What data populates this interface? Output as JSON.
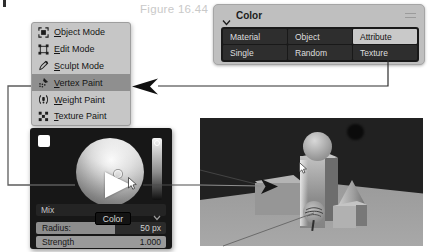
{
  "figure": {
    "caption": "Figure 16.44"
  },
  "mode_menu": {
    "items": [
      {
        "label": "Object Mode",
        "icon": "object-mode-icon",
        "selected": false
      },
      {
        "label": "Edit Mode",
        "icon": "edit-mode-icon",
        "selected": false
      },
      {
        "label": "Sculpt Mode",
        "icon": "sculpt-mode-icon",
        "selected": false
      },
      {
        "label": "Vertex Paint",
        "icon": "vertex-paint-icon",
        "selected": true
      },
      {
        "label": "Weight Paint",
        "icon": "weight-paint-icon",
        "selected": false
      },
      {
        "label": "Texture Paint",
        "icon": "texture-paint-icon",
        "selected": false
      }
    ]
  },
  "color_panel": {
    "title": "Color",
    "buttons": [
      {
        "label": "Material",
        "selected": false
      },
      {
        "label": "Object",
        "selected": false
      },
      {
        "label": "Attribute",
        "selected": true
      },
      {
        "label": "Single",
        "selected": false
      },
      {
        "label": "Random",
        "selected": false
      },
      {
        "label": "Texture",
        "selected": false
      }
    ]
  },
  "color_picker": {
    "blend_mode": "Mix",
    "tooltip": "Color",
    "radius": {
      "label": "Radius:",
      "value": "50 px"
    },
    "strength": {
      "label": "Strength",
      "value": "1.000"
    }
  },
  "viewport": {
    "objects": [
      "slab-box",
      "tall-block",
      "sphere-on-block",
      "cone",
      "cube",
      "painted-sphere"
    ]
  },
  "colors": {
    "menu_bg": "#c6c6c6",
    "menu_highlight": "#8f8f8f",
    "panel_dark": "#191919",
    "selected_button": "#c9c9c9",
    "picker_bg": "#171717",
    "viewport_bg": "#212121",
    "floor": "#9d9d9d"
  }
}
